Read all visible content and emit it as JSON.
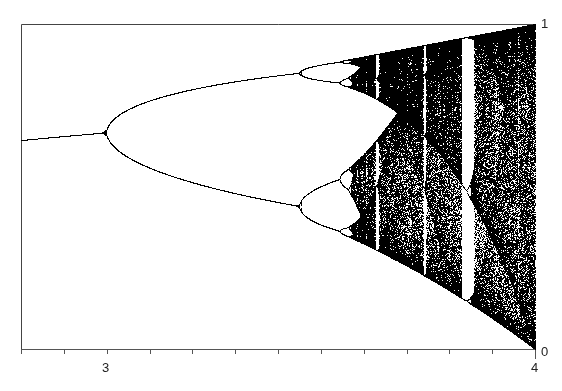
{
  "chart_data": {
    "type": "scatter",
    "title": "",
    "subtitle": "Bifurcation diagram of the logistic map x(n+1) = r·x(n)·(1 − x(n))",
    "xlabel": "",
    "ylabel": "",
    "xlim": [
      2.8,
      4.0
    ],
    "ylim": [
      0,
      1
    ],
    "grid": false,
    "legend": null,
    "x_ticks": [
      2.8,
      2.9,
      3.0,
      3.1,
      3.2,
      3.3,
      3.4,
      3.5,
      3.6,
      3.7,
      3.8,
      3.9,
      4.0
    ],
    "x_tick_labels": {
      "3.0": "3",
      "4.0": "4"
    },
    "y_tick_labels": {
      "0": "0",
      "1": "1"
    },
    "features": {
      "fixed_point_start": {
        "r": 2.8,
        "x": 0.643
      },
      "period_2_bifurcation": 3.0,
      "period_4_bifurcation": 3.449,
      "period_8_bifurcation": 3.544,
      "onset_of_chaos": 3.57,
      "period_3_window": [
        3.828,
        3.857
      ],
      "period_5_window": 3.739,
      "period_6_window": 3.628
    },
    "series": [
      {
        "name": "attractor",
        "generator": "logistic",
        "transient": 300,
        "samples_per_r": 200,
        "color": "#000000"
      }
    ]
  },
  "labels": {
    "x_tick_3": "3",
    "x_tick_4": "4",
    "y_tick_1": "1",
    "y_tick_0": "0"
  },
  "layout": {
    "plot_left": 21,
    "plot_right": 535,
    "plot_top": 24,
    "plot_bottom": 349,
    "axis_color": "#555555",
    "frame_color": "#444444"
  }
}
